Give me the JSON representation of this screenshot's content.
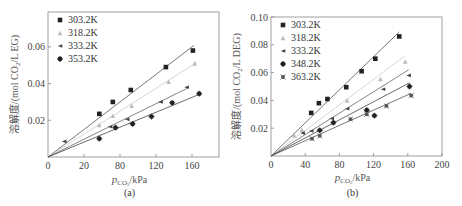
{
  "chart_data": [
    {
      "id": "a",
      "type": "scatter",
      "caption": "(a)",
      "xlabel": "p_CO2/kPa",
      "xlabel_parts": {
        "main": "p",
        "sub": "CO",
        "sub2": "2",
        "unit": "/kPa"
      },
      "ylabel": "溶解度/(mol CO2/L EG)",
      "ylabel_parts": {
        "pre": "溶解度/(mol CO",
        "sub": "2",
        "post": "/L EG)"
      },
      "xlim": [
        0,
        190
      ],
      "ylim": [
        0,
        0.079
      ],
      "xticks": [
        {
          "value": 0,
          "label": "0"
        },
        {
          "value": 40,
          "label": "20"
        },
        {
          "value": 80,
          "label": "80"
        },
        {
          "value": 120,
          "label": "120"
        },
        {
          "value": 160,
          "label": "160"
        }
      ],
      "yticks": [
        {
          "value": 0.02,
          "label": "0.02"
        },
        {
          "value": 0.04,
          "label": "0.04"
        },
        {
          "value": 0.06,
          "label": "0.06"
        }
      ],
      "origin_label": "0",
      "grid": false,
      "legend_position": "upper left",
      "series": [
        {
          "name": "303.2K",
          "marker": "square",
          "color": "#222222",
          "line_color": "#555555",
          "slope": 0.000375,
          "x_end": 162,
          "points": [
            [
              57,
              0.0235
            ],
            [
              72,
              0.03
            ],
            [
              92,
              0.0365
            ],
            [
              131,
              0.049
            ],
            [
              161,
              0.058
            ]
          ]
        },
        {
          "name": "318.2K",
          "marker": "triangle",
          "color": "#bbbbbb",
          "line_color": "#cccccc",
          "slope": 0.000312,
          "x_end": 165,
          "points": [
            [
              57,
              0.0175
            ],
            [
              72,
              0.0225
            ],
            [
              93,
              0.028
            ],
            [
              134,
              0.041
            ],
            [
              163,
              0.051
            ]
          ]
        },
        {
          "name": "333.2K",
          "marker": "left-triangle",
          "color": "#444444",
          "line_color": "#666666",
          "slope": 0.000242,
          "x_end": 155,
          "points": [
            [
              18,
              0.0085
            ],
            [
              69,
              0.0165
            ],
            [
              88,
              0.0205
            ],
            [
              125,
              0.03
            ],
            [
              154,
              0.038
            ]
          ]
        },
        {
          "name": "353.2K",
          "marker": "star",
          "color": "#222222",
          "line_color": "#444444",
          "slope": 0.000203,
          "x_end": 168,
          "points": [
            [
              57,
              0.01
            ],
            [
              75,
              0.016
            ],
            [
              94,
              0.018
            ],
            [
              115,
              0.022
            ],
            [
              138,
              0.0295
            ],
            [
              168,
              0.0345
            ]
          ]
        }
      ]
    },
    {
      "id": "b",
      "type": "scatter",
      "caption": "(b)",
      "xlabel": "p_CO2/kPa",
      "xlabel_parts": {
        "main": "p",
        "sub": "CO",
        "sub2": "2",
        "unit": "/kPa"
      },
      "ylabel": "溶解度/(mol CO2/L DEG)",
      "ylabel_parts": {
        "pre": "溶解度/(mol CO",
        "sub": "2",
        "post": "/L DEG)"
      },
      "xlim": [
        0,
        200
      ],
      "ylim": [
        0,
        0.1
      ],
      "xticks": [
        {
          "value": 0,
          "label": "0"
        },
        {
          "value": 40,
          "label": "40"
        },
        {
          "value": 80,
          "label": "80"
        },
        {
          "value": 120,
          "label": "120"
        },
        {
          "value": 160,
          "label": "160"
        },
        {
          "value": 200,
          "label": "200"
        }
      ],
      "yticks": [
        {
          "value": 0.02,
          "label": "0.02"
        },
        {
          "value": 0.04,
          "label": "0.04"
        },
        {
          "value": 0.06,
          "label": "0.06"
        },
        {
          "value": 0.08,
          "label": "0.08"
        },
        {
          "value": 0.1,
          "label": "0.10"
        }
      ],
      "origin_label": "0",
      "grid": false,
      "legend_position": "upper left",
      "series": [
        {
          "name": "303.2K",
          "marker": "square",
          "color": "#222222",
          "line_color": "#555555",
          "slope": 0.000595,
          "x_end": 150,
          "points": [
            [
              47,
              0.031
            ],
            [
              56,
              0.038
            ],
            [
              66,
              0.041
            ],
            [
              88,
              0.0495
            ],
            [
              106,
              0.061
            ],
            [
              122,
              0.07
            ],
            [
              150,
              0.086
            ]
          ]
        },
        {
          "name": "318.2K",
          "marker": "triangle",
          "color": "#bbbbbb",
          "line_color": "#cccccc",
          "slope": 0.00046,
          "x_end": 157,
          "points": [
            [
              27,
              0.015
            ],
            [
              36,
              0.019
            ],
            [
              89,
              0.04
            ],
            [
              128,
              0.0555
            ],
            [
              157,
              0.068
            ]
          ]
        },
        {
          "name": "333.2K",
          "marker": "left-triangle",
          "color": "#444444",
          "line_color": "#666666",
          "slope": 0.000385,
          "x_end": 161,
          "points": [
            [
              37,
              0.0165
            ],
            [
              47,
              0.018
            ],
            [
              71,
              0.027
            ],
            [
              89,
              0.034
            ],
            [
              131,
              0.048
            ],
            [
              161,
              0.058
            ]
          ]
        },
        {
          "name": "348.2K",
          "marker": "star",
          "color": "#222222",
          "line_color": "#444444",
          "slope": 0.000325,
          "x_end": 162,
          "points": [
            [
              57,
              0.0185
            ],
            [
              73,
              0.024
            ],
            [
              112,
              0.033
            ],
            [
              121,
              0.029
            ],
            [
              162,
              0.05
            ]
          ]
        },
        {
          "name": "363.2K",
          "marker": "asterisk",
          "color": "#555555",
          "line_color": "#555555",
          "slope": 0.000275,
          "x_end": 164,
          "points": [
            [
              48,
              0.0125
            ],
            [
              57,
              0.0145
            ],
            [
              93,
              0.0265
            ],
            [
              112,
              0.03
            ],
            [
              135,
              0.036
            ],
            [
              164,
              0.0435
            ]
          ]
        }
      ]
    }
  ]
}
